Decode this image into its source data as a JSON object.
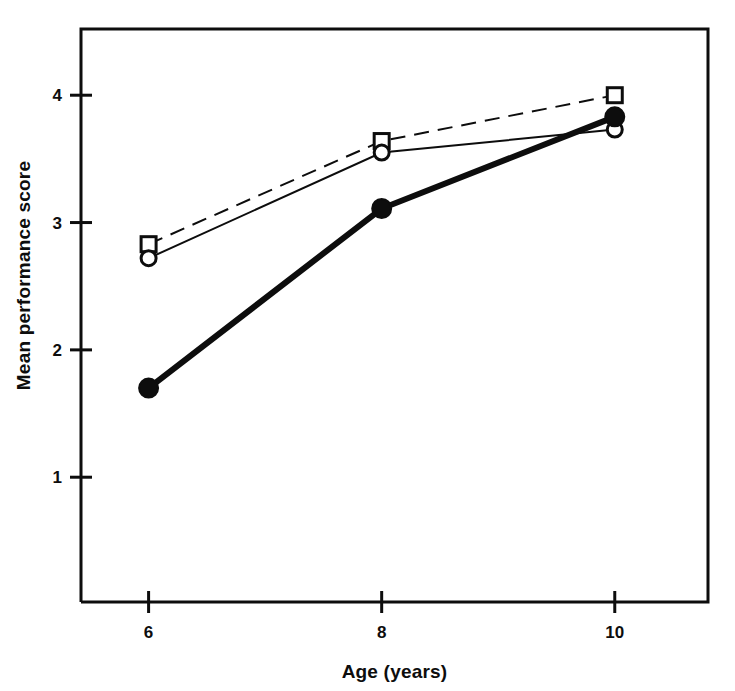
{
  "figure": {
    "background_color": "#ffffff",
    "ink_color": "#0d0d0d",
    "frame": {
      "left": 81,
      "top": 29,
      "right": 708,
      "bottom": 602,
      "line_width": 3
    }
  },
  "chart_data": {
    "type": "line",
    "title": "",
    "subtitle": "",
    "xlabel": "Age (years)",
    "ylabel": "Mean performance score",
    "x": [
      6,
      8,
      10
    ],
    "categories": [
      "6",
      "8",
      "10"
    ],
    "xtick_labels": [
      "6",
      "8",
      "10"
    ],
    "ytick_labels": [
      "1",
      "2",
      "3",
      "4"
    ],
    "yticks": [
      1,
      2,
      3,
      4
    ],
    "xlim": [
      5.42,
      10.8
    ],
    "ylim": [
      0.02,
      4.52
    ],
    "grid": false,
    "legend": false,
    "legend_position": "none",
    "annotations": [],
    "series": [
      {
        "name": "open-square-dashed",
        "marker": "open-square",
        "line_style": "dashed",
        "line_width": 2,
        "marker_size": 15,
        "color": "#0d0d0d",
        "values": [
          2.83,
          3.64,
          4.0
        ]
      },
      {
        "name": "open-circle-solid",
        "marker": "open-circle",
        "line_style": "solid",
        "line_width": 2,
        "marker_size": 15,
        "color": "#0d0d0d",
        "values": [
          2.72,
          3.55,
          3.73
        ]
      },
      {
        "name": "filled-circle-solid-thick",
        "marker": "filled-circle",
        "line_style": "solid",
        "line_width": 6,
        "marker_size": 19,
        "color": "#0d0d0d",
        "values": [
          1.7,
          3.11,
          3.83
        ]
      }
    ]
  }
}
